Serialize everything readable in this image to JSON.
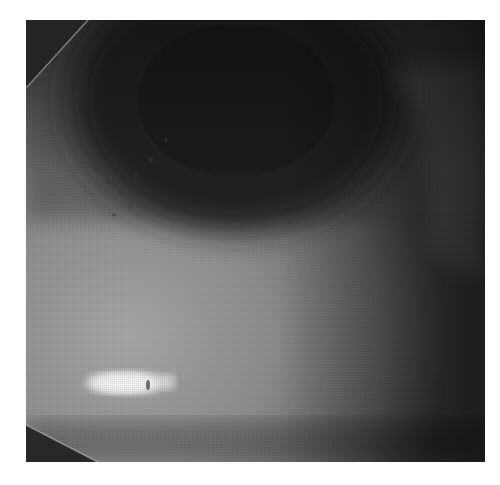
{
  "image": {
    "description": "Grayscale close-up photograph (slit-lamp style) showing a dark elliptical region at top, a brighter illuminated band in the lower-left, a bright white reflection spot, and dark angled corners at the top-left and bottom-left.",
    "colors": {
      "background": "#ffffff",
      "dark_region": "#1e1e1e",
      "mid_gray": "#6a6a6a",
      "light_band": "#b8b8b8",
      "highlight": "#f4f4f4",
      "corner_dark": "#2a2a2a"
    }
  }
}
